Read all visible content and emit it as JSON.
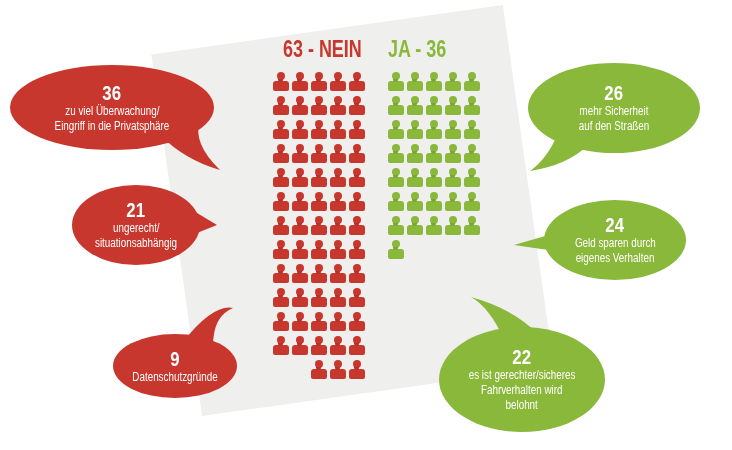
{
  "colors": {
    "nein": "#c8372d",
    "ja": "#8ab83a",
    "panel": "#efefed",
    "background": "#ffffff",
    "bubble_text": "#ffffff"
  },
  "titles": {
    "nein": "63 - NEIN",
    "ja": "JA - 36"
  },
  "bubbles": {
    "nein": [
      {
        "number": "36",
        "lines": [
          "zu viel Überwachung/",
          "Eingriff in die Privatsphäre"
        ]
      },
      {
        "number": "21",
        "lines": [
          "ungerecht/",
          "situationsabhängig"
        ]
      },
      {
        "number": "9",
        "lines": [
          "Datenschutzgründe"
        ]
      }
    ],
    "ja": [
      {
        "number": "26",
        "lines": [
          "mehr Sicherheit",
          "auf den Straßen"
        ]
      },
      {
        "number": "24",
        "lines": [
          "Geld sparen durch",
          "eigenes Verhalten"
        ]
      },
      {
        "number": "22",
        "lines": [
          "es ist gerechter/sicheres",
          "Fahrverhalten wird",
          "belohnt"
        ]
      }
    ]
  },
  "chart_data": {
    "type": "bar",
    "title": "",
    "categories": [
      "NEIN",
      "JA"
    ],
    "values": [
      63,
      36
    ],
    "icon_unit": "1 person icon = 1 respondent",
    "grid_columns": 5,
    "series": [
      {
        "name": "NEIN",
        "color": "#c8372d",
        "value": 63,
        "reasons": [
          {
            "label": "zu viel Überwachung/Eingriff in die Privatsphäre",
            "value": 36
          },
          {
            "label": "ungerecht/situationsabhängig",
            "value": 21
          },
          {
            "label": "Datenschutzgründe",
            "value": 9
          }
        ]
      },
      {
        "name": "JA",
        "color": "#8ab83a",
        "value": 36,
        "reasons": [
          {
            "label": "mehr Sicherheit auf den Straßen",
            "value": 26
          },
          {
            "label": "Geld sparen durch eigenes Verhalten",
            "value": 24
          },
          {
            "label": "es ist gerechter/sicheres Fahrverhalten wird belohnt",
            "value": 22
          }
        ]
      }
    ],
    "legend": "none",
    "grid": false
  }
}
